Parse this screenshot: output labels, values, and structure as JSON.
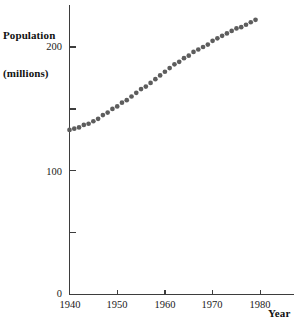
{
  "chart_data": {
    "type": "scatter",
    "title": "",
    "subtitle": "",
    "xlabel": "Year",
    "ylabel": "Population (millions)",
    "ylabel_line1": "Population",
    "ylabel_line2": "(millions)",
    "xlim": [
      1940,
      1987
    ],
    "ylim": [
      0,
      232
    ],
    "grid": false,
    "legend": null,
    "x_ticks": [
      1940,
      1950,
      1960,
      1970,
      1980
    ],
    "x_tick_labels": [
      "1940",
      "1950",
      "1960",
      "1970",
      "1980"
    ],
    "y_ticks": [
      0,
      50,
      100,
      150,
      200
    ],
    "y_tick_labels": [
      "0",
      "",
      "100",
      "",
      "200"
    ],
    "y_labeled_ticks": [
      {
        "value": 0,
        "label": "0"
      },
      {
        "value": 100,
        "label": "100"
      },
      {
        "value": 200,
        "label": "200"
      }
    ],
    "y_minor_ticks": [
      50,
      150
    ],
    "series": [
      {
        "name": "Population",
        "marker": "filled-circle",
        "color": "#5d5d5d",
        "x": [
          1940,
          1941,
          1942,
          1943,
          1944,
          1945,
          1946,
          1947,
          1948,
          1949,
          1950,
          1951,
          1952,
          1953,
          1954,
          1955,
          1956,
          1957,
          1958,
          1959,
          1960,
          1961,
          1962,
          1963,
          1964,
          1965,
          1966,
          1967,
          1968,
          1969,
          1970,
          1971,
          1972,
          1973,
          1974,
          1975,
          1976,
          1977,
          1978,
          1979
        ],
        "values": [
          133,
          134,
          135,
          137,
          138,
          140,
          142,
          145,
          147,
          150,
          152,
          155,
          157,
          160,
          163,
          166,
          168,
          171,
          174,
          177,
          180,
          183,
          186,
          188,
          191,
          193,
          196,
          198,
          200,
          202,
          205,
          207,
          209,
          211,
          213,
          215,
          216,
          218,
          220,
          222
        ]
      }
    ]
  },
  "axes": {
    "y_title_line1": "Population",
    "y_title_line2": "(millions)",
    "x_title": "Year"
  }
}
